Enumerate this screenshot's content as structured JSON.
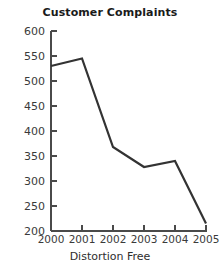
{
  "chart_data": {
    "type": "line",
    "title": "Customer Complaints",
    "xlabel": "Distortion Free",
    "ylabel": "",
    "categories": [
      "2000",
      "2001",
      "2002",
      "2003",
      "2004",
      "2005"
    ],
    "x": [
      2000,
      2001,
      2002,
      2003,
      2004,
      2005
    ],
    "values": [
      530,
      545,
      368,
      328,
      340,
      215
    ],
    "series": [
      {
        "name": "Customer Complaints",
        "values": [
          530,
          545,
          368,
          328,
          340,
          215
        ]
      }
    ],
    "xlim": [
      2000,
      2005
    ],
    "ylim": [
      200,
      600
    ],
    "ytick_labels": [
      "600",
      "550",
      "500",
      "450",
      "400",
      "350",
      "300",
      "250",
      "200"
    ],
    "ytick_values": [
      600,
      550,
      500,
      450,
      400,
      350,
      300,
      250,
      200
    ],
    "xtick_labels": [
      "2000",
      "2001",
      "2002",
      "2003",
      "2004",
      "2005"
    ],
    "grid": false,
    "legend": false,
    "legend_position": "none",
    "line_color": "#333333",
    "axis_color": "#4a4a4a",
    "background_color": "#ffffff"
  },
  "footer": {
    "caption": "Distortion Free"
  }
}
